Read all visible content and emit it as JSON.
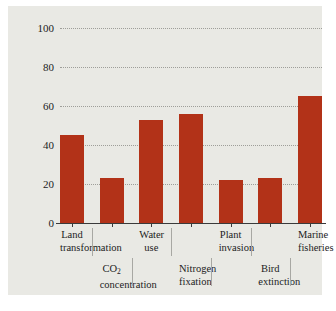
{
  "chart_data": {
    "type": "bar",
    "title": "",
    "xlabel": "",
    "ylabel": "Percentage Change",
    "ylim": [
      0,
      100
    ],
    "yticks": [
      0,
      20,
      40,
      60,
      80,
      100
    ],
    "ytick_labels": [
      "0",
      "20",
      "40",
      "60",
      "80",
      "100"
    ],
    "grid": true,
    "legend": "none",
    "bar_color": "#b23218",
    "categories": [
      "Land transformation",
      "CO2 concentration",
      "Water use",
      "Nitrogen fixation",
      "Plant invasion",
      "Bird extinction",
      "Marine fisheries"
    ],
    "values": [
      45,
      23,
      53,
      56,
      22,
      23,
      65
    ],
    "bars": [
      {
        "label_line1": "Land",
        "label_line2": "transformation",
        "row": 1,
        "value": 45
      },
      {
        "label_line1": "CO",
        "label_sub": "2",
        "label_line2": "concentration",
        "row": 2,
        "value": 23
      },
      {
        "label_line1": "Water",
        "label_line2": "use",
        "row": 1,
        "value": 53
      },
      {
        "label_line1": "Nitrogen",
        "label_line2": "fixation",
        "row": 2,
        "value": 56
      },
      {
        "label_line1": "Plant",
        "label_line2": "invasion",
        "row": 1,
        "value": 22
      },
      {
        "label_line1": "Bird",
        "label_line2": "extinction",
        "row": 2,
        "value": 23
      },
      {
        "label_line1": "Marine",
        "label_line2": "fisheries",
        "row": 1,
        "value": 65
      }
    ]
  }
}
